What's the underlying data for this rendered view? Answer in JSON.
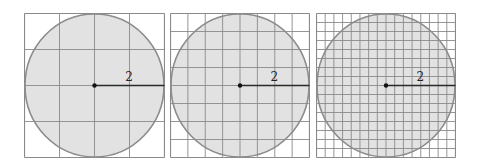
{
  "figure": {
    "colors": {
      "background": "#ffffff",
      "grid_line": "#8a8a8a",
      "circle_fill": "#e2e2e2",
      "circle_stroke": "#8c8c8c",
      "radius_line": "#2a2a2a",
      "center_dot": "#111111",
      "label": "#222222"
    },
    "panels": [
      {
        "id": "panel-1",
        "x": 24,
        "y": 13,
        "size": 140,
        "grid_divisions": 4,
        "radius_label": "2"
      },
      {
        "id": "panel-2",
        "x": 170,
        "y": 13,
        "size": 139,
        "grid_divisions": 8,
        "radius_label": "2"
      },
      {
        "id": "panel-3",
        "x": 316,
        "y": 13,
        "size": 139,
        "grid_divisions": 16,
        "radius_label": "2"
      }
    ]
  }
}
